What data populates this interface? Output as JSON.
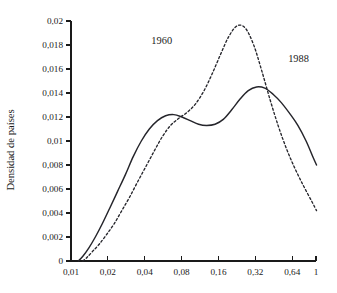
{
  "chart_data": {
    "type": "line",
    "title": "",
    "xlabel": "",
    "ylabel": "Densidad de países",
    "xscale": "log2",
    "grid": false,
    "legend_position": "inline-annotations",
    "xlim": [
      0.01,
      1
    ],
    "ylim": [
      0,
      0.02
    ],
    "x_ticks": [
      0.01,
      0.02,
      0.04,
      0.08,
      0.16,
      0.32,
      0.64,
      1
    ],
    "x_tick_labels": [
      "0,01",
      "0,02",
      "0,04",
      "0,08",
      "0,16",
      "0,32",
      "0,64",
      "1"
    ],
    "y_ticks": [
      0,
      0.002,
      0.004,
      0.006,
      0.008,
      0.01,
      0.012,
      0.014,
      0.016,
      0.018,
      0.02
    ],
    "y_tick_labels": [
      "0",
      "0,002",
      "0,004",
      "0,006",
      "0,008",
      "0,01",
      "0,012",
      "0,014",
      "0,016",
      "0,018",
      "0,02"
    ],
    "series": [
      {
        "name": "1960",
        "style": "dashed",
        "color": "#25252b",
        "label_x": 0.055,
        "label_y": 0.0181,
        "x": [
          0.0125,
          0.0135,
          0.015,
          0.017,
          0.0195,
          0.0225,
          0.026,
          0.03,
          0.035,
          0.041,
          0.048,
          0.056,
          0.065,
          0.076,
          0.089,
          0.104,
          0.122,
          0.142,
          0.166,
          0.194,
          0.227,
          0.265,
          0.31,
          0.362,
          0.423,
          0.494,
          0.577,
          0.674,
          0.787,
          0.92,
          1.01
        ],
        "y": [
          0.0,
          0.0003,
          0.0008,
          0.0014,
          0.0022,
          0.0031,
          0.0042,
          0.0053,
          0.0066,
          0.0079,
          0.0092,
          0.0104,
          0.0113,
          0.0119,
          0.0124,
          0.0131,
          0.0142,
          0.0156,
          0.0172,
          0.0187,
          0.0196,
          0.0194,
          0.018,
          0.0158,
          0.0134,
          0.0112,
          0.0093,
          0.0077,
          0.0063,
          0.005,
          0.0042
        ]
      },
      {
        "name": "1988",
        "style": "solid",
        "color": "#25252b",
        "label_x": 0.72,
        "label_y": 0.0166,
        "x": [
          0.0115,
          0.0125,
          0.014,
          0.0158,
          0.018,
          0.0207,
          0.024,
          0.0278,
          0.0322,
          0.0375,
          0.0436,
          0.0508,
          0.0592,
          0.069,
          0.0805,
          0.094,
          0.11,
          0.128,
          0.15,
          0.175,
          0.205,
          0.24,
          0.28,
          0.327,
          0.382,
          0.446,
          0.521,
          0.609,
          0.711,
          0.83,
          0.95,
          1.01
        ],
        "y": [
          0.0,
          0.0004,
          0.0011,
          0.002,
          0.0031,
          0.0044,
          0.0058,
          0.0072,
          0.0087,
          0.01,
          0.011,
          0.0117,
          0.0121,
          0.0122,
          0.012,
          0.0117,
          0.0114,
          0.0113,
          0.0114,
          0.0118,
          0.0126,
          0.0135,
          0.0142,
          0.0145,
          0.0144,
          0.0139,
          0.0132,
          0.0123,
          0.0113,
          0.01,
          0.0086,
          0.008
        ]
      }
    ]
  },
  "layout": {
    "plot_left": 71,
    "plot_right": 316,
    "plot_top": 21,
    "plot_bottom": 261,
    "tick_length": 5,
    "y_label_x": 14,
    "y_label_y": 150
  }
}
